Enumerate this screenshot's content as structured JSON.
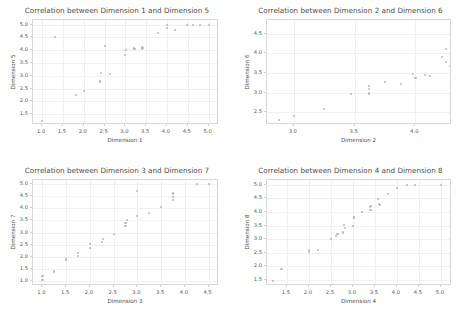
{
  "figure": {
    "width": 467,
    "height": 321,
    "background": "#ffffff",
    "point_color": "#8f8f8f",
    "grid_color": "#f0f0f0",
    "axis_color": "#d8d8d8",
    "text_color": "#4a4a4a"
  },
  "chart_data": [
    {
      "id": "panel-1",
      "type": "scatter",
      "title": "Correlation between Dimension 1 and Dimension 5",
      "xlabel": "Dimension 1",
      "ylabel": "Dimension 5",
      "xlim": [
        0.78,
        5.25
      ],
      "ylim": [
        1.08,
        5.18
      ],
      "xticks": [
        1.0,
        1.5,
        2.0,
        2.5,
        3.0,
        3.5,
        4.0,
        4.5,
        5.0
      ],
      "xticklabels": [
        "1.0",
        "1.5",
        "2.0",
        "2.5",
        "3.0",
        "3.5",
        "4.0",
        "4.5",
        "5.0"
      ],
      "yticks": [
        1.5,
        2.0,
        2.5,
        3.0,
        3.5,
        4.0,
        4.5,
        5.0
      ],
      "yticklabels": [
        "1.5",
        "2.0",
        "2.5",
        "3.0",
        "3.5",
        "4.0",
        "4.5",
        "5.0"
      ],
      "grid": true,
      "legend": null,
      "points": [
        [
          1.0,
          1.25
        ],
        [
          1.3,
          4.52
        ],
        [
          1.82,
          2.25
        ],
        [
          2.0,
          2.4
        ],
        [
          2.38,
          2.78
        ],
        [
          2.42,
          3.1
        ],
        [
          2.5,
          4.15
        ],
        [
          2.62,
          3.08
        ],
        [
          3.0,
          3.8
        ],
        [
          3.02,
          4.0
        ],
        [
          3.2,
          4.08
        ],
        [
          3.22,
          4.05
        ],
        [
          3.4,
          4.12
        ],
        [
          3.4,
          4.05
        ],
        [
          3.42,
          4.08
        ],
        [
          3.78,
          4.68
        ],
        [
          4.0,
          4.98
        ],
        [
          4.0,
          4.85
        ],
        [
          4.2,
          4.8
        ],
        [
          4.48,
          5.0
        ],
        [
          4.62,
          5.0
        ],
        [
          4.8,
          5.0
        ],
        [
          5.0,
          5.0
        ]
      ]
    },
    {
      "id": "panel-2",
      "type": "scatter",
      "title": "Correlation between Dimension 2 and Dimension 6",
      "xlabel": "Dimension 2",
      "ylabel": "Dimension 6",
      "xlim": [
        2.78,
        4.3
      ],
      "ylim": [
        2.18,
        4.85
      ],
      "xticks": [
        3.0,
        3.5,
        4.0
      ],
      "xticklabels": [
        "3.0",
        "3.5",
        "4.0"
      ],
      "yticks": [
        2.5,
        3.0,
        3.5,
        4.0,
        4.5
      ],
      "yticklabels": [
        "2.5",
        "3.0",
        "3.5",
        "4.0",
        "4.5"
      ],
      "grid": true,
      "legend": null,
      "points": [
        [
          2.88,
          2.3
        ],
        [
          3.0,
          2.4
        ],
        [
          3.25,
          2.58
        ],
        [
          3.47,
          2.96
        ],
        [
          3.62,
          2.98
        ],
        [
          3.62,
          3.1
        ],
        [
          3.62,
          3.18
        ],
        [
          3.75,
          3.28
        ],
        [
          3.88,
          3.22
        ],
        [
          3.98,
          3.48
        ],
        [
          4.0,
          3.38
        ],
        [
          4.08,
          3.45
        ],
        [
          4.12,
          3.42
        ],
        [
          4.22,
          3.9
        ],
        [
          4.25,
          4.12
        ],
        [
          4.25,
          3.78
        ],
        [
          4.28,
          3.68
        ],
        [
          4.38,
          4.02
        ],
        [
          4.5,
          4.22
        ],
        [
          4.5,
          4.12
        ],
        [
          4.75,
          4.48
        ],
        [
          4.88,
          4.55
        ],
        [
          5.12,
          4.72
        ]
      ]
    },
    {
      "id": "panel-3",
      "type": "scatter",
      "title": "Correlation between Dimension 3 and Dimension 7",
      "xlabel": "Dimension 3",
      "ylabel": "Dimension 7",
      "xlim": [
        0.8,
        4.72
      ],
      "ylim": [
        0.78,
        5.18
      ],
      "xticks": [
        1.0,
        1.5,
        2.0,
        2.5,
        3.0,
        3.5,
        4.0,
        4.5
      ],
      "xticklabels": [
        "1.0",
        "1.5",
        "2.0",
        "2.5",
        "3.0",
        "3.5",
        "4.0",
        "4.5"
      ],
      "yticks": [
        1.0,
        1.5,
        2.0,
        2.5,
        3.0,
        3.5,
        4.0,
        4.5,
        5.0
      ],
      "yticklabels": [
        "1.0",
        "1.5",
        "2.0",
        "2.5",
        "3.0",
        "3.5",
        "4.0",
        "4.5",
        "5.0"
      ],
      "grid": true,
      "legend": null,
      "points": [
        [
          1.0,
          1.02
        ],
        [
          1.0,
          1.2
        ],
        [
          1.25,
          1.38
        ],
        [
          1.5,
          1.88
        ],
        [
          1.75,
          2.02
        ],
        [
          1.75,
          2.15
        ],
        [
          2.0,
          2.35
        ],
        [
          2.0,
          2.52
        ],
        [
          2.25,
          2.6
        ],
        [
          2.28,
          2.72
        ],
        [
          2.5,
          2.95
        ],
        [
          2.75,
          3.28
        ],
        [
          2.75,
          3.38
        ],
        [
          2.78,
          3.52
        ],
        [
          3.0,
          3.68
        ],
        [
          3.0,
          4.72
        ],
        [
          3.25,
          3.82
        ],
        [
          3.5,
          4.05
        ],
        [
          3.75,
          4.35
        ],
        [
          3.75,
          4.48
        ],
        [
          3.75,
          4.62
        ],
        [
          4.25,
          5.0
        ],
        [
          4.5,
          5.0
        ]
      ]
    },
    {
      "id": "panel-4",
      "type": "scatter",
      "title": "Correlation between Dimension 4 and Dimension 8",
      "xlabel": "Dimension 4",
      "ylabel": "Dimension 8",
      "xlim": [
        1.05,
        5.25
      ],
      "ylim": [
        1.28,
        5.18
      ],
      "xticks": [
        1.5,
        2.0,
        2.5,
        3.0,
        3.5,
        4.0,
        4.5,
        5.0
      ],
      "xticklabels": [
        "1.5",
        "2.0",
        "2.5",
        "3.0",
        "3.5",
        "4.0",
        "4.5",
        "5.0"
      ],
      "yticks": [
        1.5,
        2.0,
        2.5,
        3.0,
        3.5,
        4.0,
        4.5,
        5.0
      ],
      "yticklabels": [
        "1.5",
        "2.0",
        "2.5",
        "3.0",
        "3.5",
        "4.0",
        "4.5",
        "5.0"
      ],
      "grid": true,
      "legend": null,
      "points": [
        [
          1.18,
          1.45
        ],
        [
          1.38,
          1.9
        ],
        [
          2.0,
          2.52
        ],
        [
          2.0,
          2.62
        ],
        [
          2.2,
          2.6
        ],
        [
          2.5,
          3.0
        ],
        [
          2.62,
          3.12
        ],
        [
          2.65,
          3.18
        ],
        [
          2.78,
          3.25
        ],
        [
          2.8,
          3.52
        ],
        [
          2.82,
          3.42
        ],
        [
          3.0,
          3.5
        ],
        [
          3.02,
          3.8
        ],
        [
          3.2,
          4.0
        ],
        [
          3.38,
          4.18
        ],
        [
          3.4,
          4.08
        ],
        [
          3.42,
          4.22
        ],
        [
          3.58,
          4.48
        ],
        [
          3.6,
          4.3
        ],
        [
          3.62,
          4.25
        ],
        [
          3.8,
          4.65
        ],
        [
          4.0,
          4.88
        ],
        [
          4.22,
          5.0
        ],
        [
          4.42,
          5.0
        ],
        [
          5.0,
          5.0
        ]
      ]
    }
  ]
}
